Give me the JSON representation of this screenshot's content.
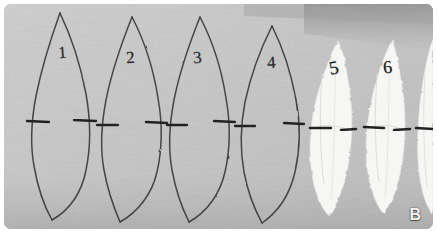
{
  "figure": {
    "panel_label": "B",
    "background_color": "#c5c5c5",
    "border_color": "#ffffff",
    "ink_color": "#2b2b2b",
    "specimen_light_color": "#f4f4f2",
    "shade_band_color": "#9a9a9a",
    "width": 437,
    "height": 233
  },
  "specimens": [
    {
      "id": "leaf-1",
      "label": "1",
      "type": "outline",
      "label_x": 60,
      "label_y": 48,
      "apex_x": 60,
      "apex_y": 13,
      "base_x": 52,
      "base_y": 220,
      "half_width": 30,
      "mid_y": 120,
      "tick_y": 118,
      "tick_left": 26,
      "tick_right": 50
    },
    {
      "id": "leaf-2",
      "label": "2",
      "type": "outline",
      "label_x": 129,
      "label_y": 55,
      "apex_x": 133,
      "apex_y": 17,
      "base_x": 120,
      "base_y": 222,
      "half_width": 30,
      "mid_y": 120,
      "tick_y": 120,
      "tick_left": 96,
      "tick_right": 120
    },
    {
      "id": "leaf-3",
      "label": "3",
      "type": "outline",
      "label_x": 194,
      "label_y": 55,
      "apex_x": 198,
      "apex_y": 17,
      "base_x": 190,
      "base_y": 222,
      "half_width": 30,
      "mid_y": 120,
      "tick_y": 120,
      "tick_left": 163,
      "tick_right": 190
    },
    {
      "id": "leaf-4",
      "label": "4",
      "type": "outline",
      "label_x": 269,
      "label_y": 58,
      "apex_x": 272,
      "apex_y": 26,
      "base_x": 268,
      "base_y": 222,
      "half_width": 28,
      "mid_y": 122,
      "tick_y": 122,
      "tick_left": 234,
      "tick_right": 262
    },
    {
      "id": "leaf-5",
      "label": "5",
      "type": "specimen",
      "label_x": 334,
      "label_y": 62,
      "apex_x": 340,
      "apex_y": 40,
      "base_x": 330,
      "base_y": 215,
      "half_width": 22,
      "mid_y": 124,
      "tick_y": 124,
      "tick_left": 310,
      "tick_right": 336
    },
    {
      "id": "leaf-6",
      "label": "6",
      "type": "specimen",
      "label_x": 386,
      "label_y": 62,
      "apex_x": 392,
      "apex_y": 40,
      "base_x": 384,
      "base_y": 212,
      "half_width": 21,
      "mid_y": 124,
      "tick_y": 124,
      "tick_left": 364,
      "tick_right": 390
    },
    {
      "id": "leaf-7",
      "label": "",
      "type": "specimen-partial",
      "label_x": 0,
      "label_y": 0,
      "apex_x": 436,
      "apex_y": 42,
      "base_x": 432,
      "base_y": 212,
      "half_width": 14,
      "mid_y": 124,
      "tick_y": 124,
      "tick_left": 418,
      "tick_right": 436
    }
  ],
  "notes": {
    "caption_letter": "B",
    "specimen_count_visible": "7",
    "numbered_specimens": "1, 2, 3, 4, 5, 6"
  }
}
